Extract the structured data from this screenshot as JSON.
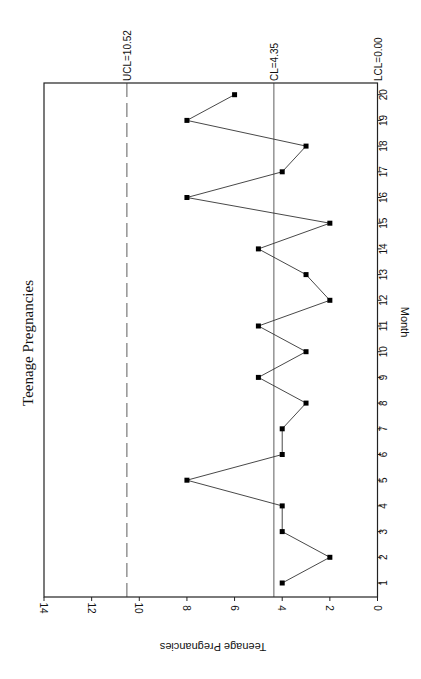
{
  "chart_data": {
    "type": "line",
    "subtype": "control chart (c-chart)",
    "orientation": "rotated 90 degrees clockwise",
    "title": "Teenage Pregnancies",
    "xlabel": "Month",
    "ylabel": "Teenage Pregnancies",
    "x": [
      1,
      2,
      3,
      4,
      5,
      6,
      7,
      8,
      9,
      10,
      11,
      12,
      13,
      14,
      15,
      16,
      17,
      18,
      19,
      20
    ],
    "series": [
      {
        "name": "Teenage Pregnancies",
        "values": [
          4,
          2,
          4,
          4,
          8,
          4,
          4,
          3,
          5,
          3,
          5,
          2,
          3,
          5,
          2,
          8,
          4,
          3,
          8,
          6
        ]
      }
    ],
    "control_lines": [
      {
        "name": "UCL",
        "label": "UCL=10.52",
        "value": 10.52,
        "style": "dashed"
      },
      {
        "name": "CL",
        "label": "CL=4.35",
        "value": 4.35,
        "style": "solid"
      },
      {
        "name": "LCL",
        "label": "LCL=0.00",
        "value": 0.0,
        "style": "solid"
      }
    ],
    "xticks": [
      "1",
      "2",
      "3",
      "4",
      "5",
      "6",
      "7",
      "8",
      "9",
      "10",
      "11",
      "12",
      "13",
      "14",
      "15",
      "16",
      "17",
      "18",
      "19",
      "20"
    ],
    "yticks": [
      "0",
      "2",
      "4",
      "6",
      "8",
      "10",
      "12",
      "14"
    ],
    "ylim": [
      0,
      14
    ],
    "xlim": [
      0.5,
      20.5
    ],
    "grid": false,
    "legend": null
  }
}
